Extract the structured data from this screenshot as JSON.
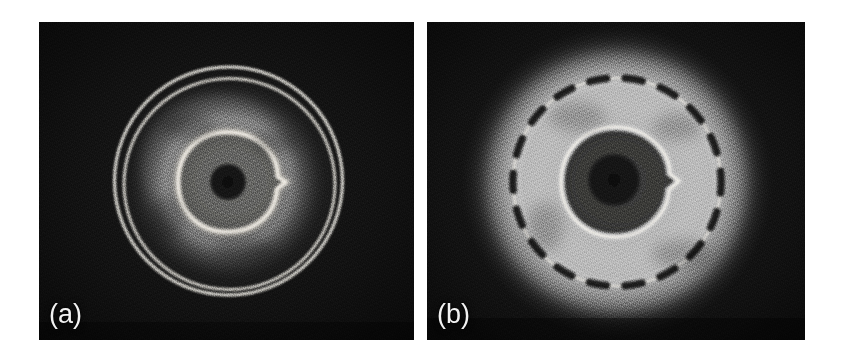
{
  "figure": {
    "background_color": "#ffffff",
    "width": 842,
    "height": 355,
    "panel_count": 2
  },
  "panels": [
    {
      "id": "panel-a",
      "label": "(a)",
      "label_color": "#f2f2f2",
      "bounds": {
        "x": 39,
        "y": 22,
        "width": 375,
        "height": 318
      },
      "background_color": "#0d0d0d",
      "description": "Dark-field cross-section showing two closely spaced thin bright concentric rings, a diffuse bright halo, a bright inner ring with a notch on the right, a mid-gray disc and a dark central core.",
      "center": {
        "x": 189,
        "y": 160
      },
      "features": {
        "outer_ring_1_radius": 114,
        "outer_ring_2_radius": 105,
        "halo_outer_radius": 78,
        "halo_inner_radius": 38,
        "bright_ring_radius": 50,
        "gray_disc_radius": 44,
        "core_radius": 17,
        "notch_angle_deg": 12,
        "ring_color": "#e8e6e0",
        "halo_color": "#b9b7b2",
        "disc_color": "#6a6a68",
        "core_color": "#141414"
      }
    },
    {
      "id": "panel-b",
      "label": "(b)",
      "label_color": "#f2f2f2",
      "bounds": {
        "x": 427,
        "y": 22,
        "width": 378,
        "height": 318
      },
      "background_color": "#0d0d0d",
      "description": "Inverted-contrast cross-section showing a broad bright diffuse disc crossed by a beaded dashed dark ring, a thin bright inner ring with a notch on the right, a dark annulus and a darker central core.",
      "center": {
        "x": 190,
        "y": 160
      },
      "features": {
        "dashed_ring_radius": 104,
        "dash_count": 18,
        "bright_halo_outer_radius": 128,
        "bright_ring_radius": 55,
        "dark_annulus_radius": 52,
        "core_radius": 24,
        "notch_angle_deg": 10,
        "ring_color": "#efece6",
        "halo_color": "#a9a6a0",
        "annulus_color": "#3a3a39",
        "core_color": "#131313",
        "dash_color": "#101010"
      }
    }
  ],
  "separator": {
    "name": "panel-gap",
    "x": 414,
    "width": 13,
    "color": "#ffffff"
  }
}
